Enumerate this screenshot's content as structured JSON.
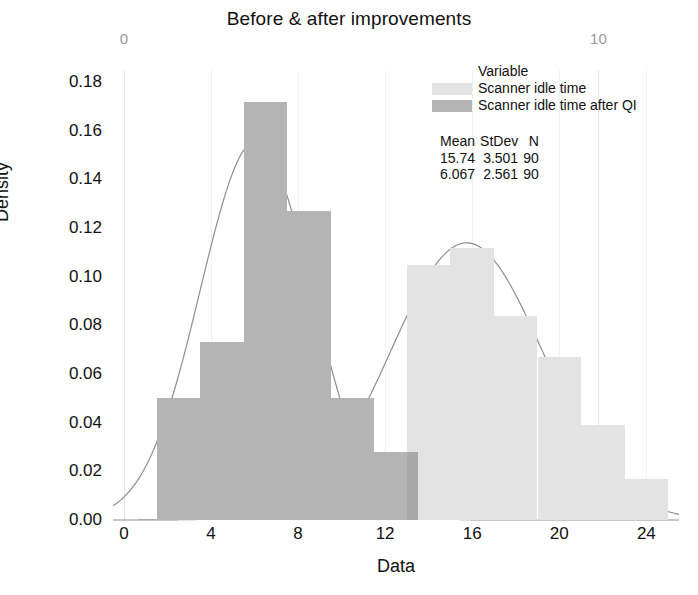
{
  "chart_data": {
    "type": "bar",
    "title": "Before & after improvements",
    "xlabel": "Data",
    "ylabel": "Density",
    "xlim": [
      -0.5,
      25.5
    ],
    "ylim": [
      0.0,
      0.185
    ],
    "xticks": [
      "0",
      "4",
      "8",
      "12",
      "16",
      "20",
      "24"
    ],
    "xtick_values": [
      0,
      4,
      8,
      12,
      16,
      20,
      24
    ],
    "yticks": [
      "0.00",
      "0.02",
      "0.04",
      "0.06",
      "0.08",
      "0.10",
      "0.12",
      "0.14",
      "0.16",
      "0.18"
    ],
    "ytick_values": [
      0.0,
      0.02,
      0.04,
      0.06,
      0.08,
      0.1,
      0.12,
      0.14,
      0.16,
      0.18
    ],
    "grid": true,
    "legend_position": "upper right",
    "secondary_top_axis": {
      "ticks": [
        "0",
        "10"
      ],
      "tick_values": [
        0,
        10
      ]
    },
    "series": [
      {
        "name": "Scanner idle time",
        "color": "#e3e3e3",
        "bin_width": 2,
        "bin_edges": [
          13,
          15,
          17,
          19,
          21,
          23,
          25
        ],
        "values": [
          0.105,
          0.112,
          0.084,
          0.067,
          0.039,
          0.017
        ],
        "fit": {
          "type": "normal",
          "mean": 15.74,
          "stdev": 3.501,
          "n": 90
        }
      },
      {
        "name": "Scanner idle time after QI",
        "color": "#b4b4b4",
        "bin_width": 2,
        "bin_edges": [
          1.5,
          3.5,
          5.5,
          7.5,
          9.5,
          11.5,
          13.5
        ],
        "values": [
          0.05,
          0.073,
          0.172,
          0.127,
          0.05,
          0.028
        ],
        "fit": {
          "type": "normal",
          "mean": 6.067,
          "stdev": 2.561,
          "n": 90
        }
      }
    ]
  },
  "legend": {
    "title": "Variable",
    "entries": [
      {
        "label": "Scanner idle time",
        "color": "#e3e3e3"
      },
      {
        "label": "Scanner idle time after QI",
        "color": "#b4b4b4"
      }
    ]
  },
  "stats_table": {
    "headers": [
      "Mean",
      "StDev",
      "N"
    ],
    "rows": [
      [
        "15.74",
        "3.501",
        "90"
      ],
      [
        "6.067",
        "2.561",
        "90"
      ]
    ]
  }
}
